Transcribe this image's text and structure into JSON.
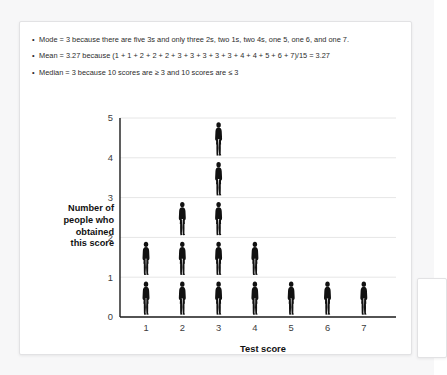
{
  "page": {
    "background_color": "#f7f7f8",
    "card_background": "#ffffff",
    "card_border_color": "#e2e2e4"
  },
  "bullets": [
    {
      "marker": "•",
      "text": "Mode = 3 because there are five 3s and only three 2s, two 1s, two 4s, one 5, one 6, and one 7."
    },
    {
      "marker": "•",
      "text": "Mean = 3.27 because (1 + 1 + 2 + 2 + 2 + 3 + 3 + 3 + 3 + 3 + 4 + 4 + 5 + 6 + 7)/15 = 3.27"
    },
    {
      "marker": "•",
      "text": "Median = 3 because 10 scores are ≥ 3 and 10 scores are ≤ 3"
    }
  ],
  "chart_data": {
    "type": "bar",
    "title": "",
    "subtitle": "",
    "xlabel": "Test score",
    "ylabel": "Number of people who obtained this score",
    "ylabel_lines": [
      "Number of",
      "people who",
      "obtained",
      "this score"
    ],
    "categories": [
      "1",
      "2",
      "3",
      "4",
      "5",
      "6",
      "7"
    ],
    "values": [
      2,
      3,
      5,
      2,
      1,
      1,
      1
    ],
    "x_tick_labels": [
      "1",
      "2",
      "3",
      "4",
      "5",
      "6",
      "7"
    ],
    "y_tick_labels": [
      "0",
      "1",
      "2",
      "3",
      "4",
      "5"
    ],
    "y_ticks": [
      0,
      1,
      2,
      3,
      4,
      5
    ],
    "ylim": [
      0,
      5
    ],
    "grid": true,
    "grid_color": "#e6e6e6",
    "axis_color": "#1a1a1a",
    "legend": "none",
    "pictogram": true,
    "pictogram_icon": "person-icon",
    "pictogram_unit_value": 1,
    "marker_color": "#111111",
    "total_count": 15
  }
}
